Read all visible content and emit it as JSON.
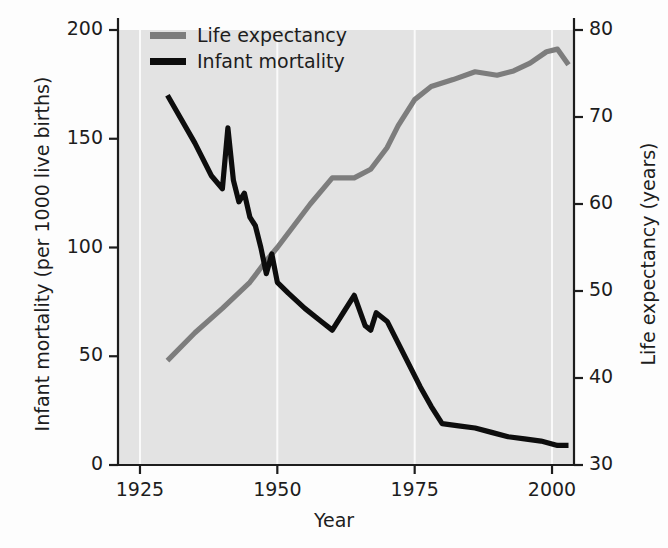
{
  "chart_data": {
    "type": "line",
    "title": "",
    "xlabel": "Year",
    "ylabel": "Infant mortality (per 1000 live births)",
    "ylabel_right": "Life expectancy (years)",
    "xlim": [
      1921,
      2004
    ],
    "ylim": [
      0,
      200
    ],
    "ylim_right": [
      30,
      80
    ],
    "xticks": [
      1925,
      1950,
      1975,
      2000
    ],
    "xtick_labels": [
      "1925",
      "1950",
      "1975",
      "2000"
    ],
    "yticks": [
      0,
      50,
      100,
      150,
      200
    ],
    "ytick_labels": [
      "0",
      "50",
      "100",
      "150",
      "200"
    ],
    "yticks_right": [
      30,
      40,
      50,
      60,
      70,
      80
    ],
    "ytick_labels_right": [
      "30",
      "40",
      "50",
      "60",
      "70",
      "80"
    ],
    "grid": "vertical white gridlines at x ticks",
    "legend_position": "top-left inside axes",
    "plot_background": "#e3e3e3",
    "series": [
      {
        "name": "Life expectancy",
        "axis": "right",
        "color": "#7d7d7d",
        "x": [
          1930,
          1935,
          1940,
          1945,
          1948,
          1950,
          1953,
          1956,
          1960,
          1964,
          1967,
          1970,
          1972,
          1975,
          1978,
          1982,
          1986,
          1990,
          1993,
          1996,
          1999,
          2001,
          2003
        ],
        "values": [
          42.0,
          45.2,
          48.0,
          51.0,
          53.5,
          55.0,
          57.5,
          60.0,
          63.0,
          63.0,
          64.0,
          66.5,
          69.0,
          72.0,
          73.5,
          74.3,
          75.2,
          74.8,
          75.3,
          76.2,
          77.5,
          77.8,
          76.0
        ]
      },
      {
        "name": "Infant mortality",
        "axis": "left",
        "color": "#0d0d0d",
        "x": [
          1930,
          1935,
          1938,
          1940,
          1941,
          1942,
          1943,
          1944,
          1945,
          1946,
          1947,
          1948,
          1949,
          1950,
          1952,
          1955,
          1958,
          1960,
          1962,
          1964,
          1966,
          1967,
          1968,
          1970,
          1972,
          1974,
          1976,
          1978,
          1980,
          1983,
          1986,
          1989,
          1992,
          1995,
          1998,
          2001,
          2003
        ],
        "values": [
          170,
          148,
          133,
          127,
          155,
          131,
          121,
          125,
          114,
          110,
          100,
          88,
          97,
          84,
          79,
          72,
          66,
          62,
          70,
          78,
          64,
          62,
          70,
          66,
          56,
          46,
          36,
          27,
          19,
          18,
          17,
          15,
          13,
          12,
          11,
          9,
          9
        ]
      }
    ]
  },
  "legend": {
    "items": [
      {
        "label": "Life expectancy",
        "color": "#7d7d7d"
      },
      {
        "label": "Infant mortality",
        "color": "#0d0d0d"
      }
    ]
  }
}
